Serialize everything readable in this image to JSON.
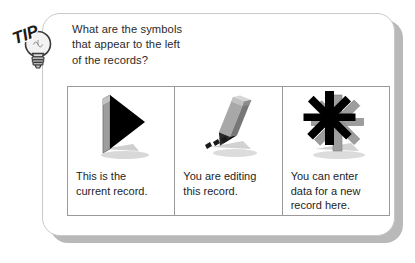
{
  "card": {
    "badge": {
      "label": "TIP",
      "icon": "lightbulb-icon"
    },
    "question": {
      "lines": [
        "What are the symbols",
        "that appear to the left",
        "of the records?"
      ]
    },
    "panels": [
      {
        "icon": "triangle-right-icon",
        "caption_lines": [
          "This is the",
          "current record."
        ]
      },
      {
        "icon": "pencil-icon",
        "caption_lines": [
          "You are editing",
          "this record."
        ]
      },
      {
        "icon": "asterisk-icon",
        "caption_lines": [
          "You can enter",
          "data for a new",
          "record here."
        ]
      }
    ]
  },
  "colors": {
    "card_border": "#c9c9c9",
    "card_shadow": "#b9b9b9",
    "panel_border": "#9a9a9a",
    "icon_black": "#000000",
    "icon_gray": "#9d9d9d",
    "icon_gray_light": "#c8c8c8",
    "text": "#1e1e1e"
  }
}
